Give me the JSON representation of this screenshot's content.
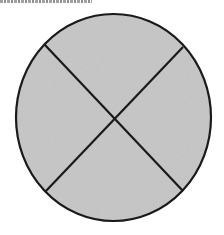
{
  "figure": {
    "shape": "circle",
    "fill_color": "#c6c6c6",
    "stroke_color": "#1a1a1a",
    "center": [
      113.5,
      117.5
    ],
    "radius_x": 97.5,
    "radius_y": 103.5,
    "lines": [
      {
        "from": [
          45,
          45
        ],
        "to": [
          183,
          191
        ]
      },
      {
        "from": [
          183,
          47
        ],
        "to": [
          45,
          192
        ]
      }
    ],
    "regions": 4
  }
}
